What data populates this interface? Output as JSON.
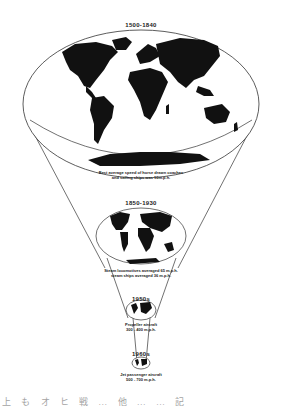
{
  "diagram": {
    "type": "shrinking-world-funnel",
    "colors": {
      "land": "#111111",
      "outline": "#333333",
      "background": "#ffffff"
    },
    "stages": [
      {
        "era": "1500-1840",
        "caption_lines": [
          "Best average speed of horse drawn coaches",
          "and sailing ships was 10m.p.h."
        ]
      },
      {
        "era": "1850-1930",
        "caption_lines": [
          "Steam locomotives averaged 65 m.p.h.",
          "steam ships averaged 36 m.p.h."
        ]
      },
      {
        "era": "1950s",
        "caption_lines": [
          "Propeller aircraft",
          "300 - 400 m.p.h."
        ]
      },
      {
        "era": "1960s",
        "caption_lines": [
          "Jet passenger aircraft",
          "500 - 700 m.p.h."
        ]
      }
    ],
    "footer_garbled_text": "上 も オ ヒ 戦 … 他 … … 記"
  }
}
